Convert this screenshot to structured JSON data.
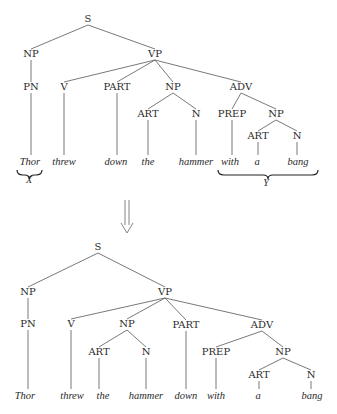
{
  "diagram": {
    "type": "syntax-tree-transformation",
    "trees": [
      {
        "id": "before",
        "nodes": [
          {
            "id": "S",
            "label": "S",
            "x": 88,
            "y": 22
          },
          {
            "id": "NP1",
            "label": "NP",
            "x": 31,
            "y": 57
          },
          {
            "id": "VP",
            "label": "VP",
            "x": 155,
            "y": 57
          },
          {
            "id": "PN",
            "label": "PN",
            "x": 31,
            "y": 90
          },
          {
            "id": "V",
            "label": "V",
            "x": 64,
            "y": 90
          },
          {
            "id": "PART",
            "label": "PART",
            "x": 117,
            "y": 90
          },
          {
            "id": "NP2",
            "label": "NP",
            "x": 173,
            "y": 90
          },
          {
            "id": "ADV",
            "label": "ADV",
            "x": 241,
            "y": 90
          },
          {
            "id": "ART1",
            "label": "ART",
            "x": 148,
            "y": 117
          },
          {
            "id": "N1",
            "label": "N",
            "x": 196,
            "y": 117
          },
          {
            "id": "PREP",
            "label": "PREP",
            "x": 232,
            "y": 117
          },
          {
            "id": "NP3",
            "label": "NP",
            "x": 276,
            "y": 117
          },
          {
            "id": "ART2",
            "label": "ART",
            "x": 258,
            "y": 139
          },
          {
            "id": "N2",
            "label": "N",
            "x": 297,
            "y": 139
          }
        ],
        "leaves": [
          {
            "id": "w1",
            "label": "Thor",
            "x": 30,
            "y": 165,
            "parent": "PN"
          },
          {
            "id": "w2",
            "label": "threw",
            "x": 64,
            "y": 165,
            "parent": "V"
          },
          {
            "id": "w3",
            "label": "down",
            "x": 116,
            "y": 165,
            "parent": "PART"
          },
          {
            "id": "w4",
            "label": "the",
            "x": 148,
            "y": 165,
            "parent": "ART1"
          },
          {
            "id": "w5",
            "label": "hammer",
            "x": 196,
            "y": 165,
            "parent": "N1"
          },
          {
            "id": "w6",
            "label": "with",
            "x": 230,
            "y": 165,
            "parent": "PREP"
          },
          {
            "id": "w7",
            "label": "a",
            "x": 257,
            "y": 165,
            "parent": "ART2"
          },
          {
            "id": "w8",
            "label": "bang",
            "x": 298,
            "y": 165,
            "parent": "N2"
          }
        ],
        "edges": [
          [
            "S",
            "NP1"
          ],
          [
            "S",
            "VP"
          ],
          [
            "NP1",
            "PN"
          ],
          [
            "VP",
            "V"
          ],
          [
            "VP",
            "PART"
          ],
          [
            "VP",
            "NP2"
          ],
          [
            "VP",
            "ADV"
          ],
          [
            "NP2",
            "ART1"
          ],
          [
            "NP2",
            "N1"
          ],
          [
            "ADV",
            "PREP"
          ],
          [
            "ADV",
            "NP3"
          ],
          [
            "NP3",
            "ART2"
          ],
          [
            "NP3",
            "N2"
          ]
        ],
        "annotations": [
          {
            "label": "X",
            "brace_from": 17,
            "brace_to": 42,
            "brace_y": 170,
            "label_x": 29,
            "label_y": 183
          },
          {
            "label": "Y",
            "brace_from": 218,
            "brace_to": 318,
            "brace_y": 170,
            "label_x": 266,
            "label_y": 186
          }
        ]
      },
      {
        "id": "after",
        "nodes": [
          {
            "id": "S",
            "label": "S",
            "x": 98,
            "y": 250
          },
          {
            "id": "NP1",
            "label": "NP",
            "x": 28,
            "y": 295
          },
          {
            "id": "VP",
            "label": "VP",
            "x": 165,
            "y": 295
          },
          {
            "id": "PN",
            "label": "PN",
            "x": 28,
            "y": 327
          },
          {
            "id": "V",
            "label": "V",
            "x": 71,
            "y": 327
          },
          {
            "id": "NP2",
            "label": "NP",
            "x": 127,
            "y": 327
          },
          {
            "id": "PART",
            "label": "PART",
            "x": 186,
            "y": 328
          },
          {
            "id": "ADV",
            "label": "ADV",
            "x": 262,
            "y": 328
          },
          {
            "id": "ART1",
            "label": "ART",
            "x": 99,
            "y": 355
          },
          {
            "id": "N1",
            "label": "N",
            "x": 146,
            "y": 355
          },
          {
            "id": "PREP",
            "label": "PREP",
            "x": 216,
            "y": 355
          },
          {
            "id": "NP3",
            "label": "NP",
            "x": 283,
            "y": 355
          },
          {
            "id": "ART2",
            "label": "ART",
            "x": 259,
            "y": 378
          },
          {
            "id": "N2",
            "label": "N",
            "x": 311,
            "y": 378
          }
        ],
        "leaves": [
          {
            "id": "w1",
            "label": "Thor",
            "x": 25,
            "y": 399,
            "parent": "PN"
          },
          {
            "id": "w2",
            "label": "threw",
            "x": 72,
            "y": 399,
            "parent": "V"
          },
          {
            "id": "w3",
            "label": "the",
            "x": 103,
            "y": 399,
            "parent": "ART1"
          },
          {
            "id": "w4",
            "label": "hammer",
            "x": 146,
            "y": 399,
            "parent": "N1"
          },
          {
            "id": "w5",
            "label": "down",
            "x": 186,
            "y": 399,
            "parent": "PART"
          },
          {
            "id": "w6",
            "label": "with",
            "x": 216,
            "y": 399,
            "parent": "PREP"
          },
          {
            "id": "w7",
            "label": "a",
            "x": 258,
            "y": 399,
            "parent": "ART2"
          },
          {
            "id": "w8",
            "label": "bang",
            "x": 312,
            "y": 399,
            "parent": "N2"
          }
        ],
        "edges": [
          [
            "S",
            "NP1"
          ],
          [
            "S",
            "VP"
          ],
          [
            "NP1",
            "PN"
          ],
          [
            "VP",
            "V"
          ],
          [
            "VP",
            "NP2"
          ],
          [
            "VP",
            "PART"
          ],
          [
            "VP",
            "ADV"
          ],
          [
            "NP2",
            "ART1"
          ],
          [
            "NP2",
            "N1"
          ],
          [
            "ADV",
            "PREP"
          ],
          [
            "ADV",
            "NP3"
          ],
          [
            "NP3",
            "ART2"
          ],
          [
            "NP3",
            "N2"
          ]
        ],
        "annotations": []
      }
    ],
    "transformation_arrow": {
      "symbol": "double-down-arrow",
      "x": 127,
      "y_top": 200,
      "y_bottom": 233
    }
  }
}
